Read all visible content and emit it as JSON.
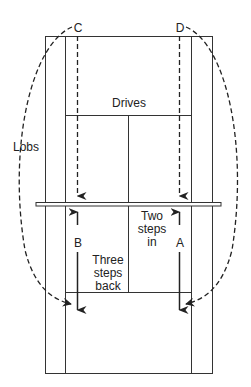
{
  "diagram": {
    "type": "tennis-court-positioning",
    "labels": {
      "c": "C",
      "d": "D",
      "drives": "Drives",
      "lobs": "Lobs",
      "a": "A",
      "b": "B",
      "two_steps_in": "Two steps in",
      "three_steps_back": "Three steps back"
    },
    "colors": {
      "line": "#333333",
      "background": "#ffffff"
    }
  }
}
